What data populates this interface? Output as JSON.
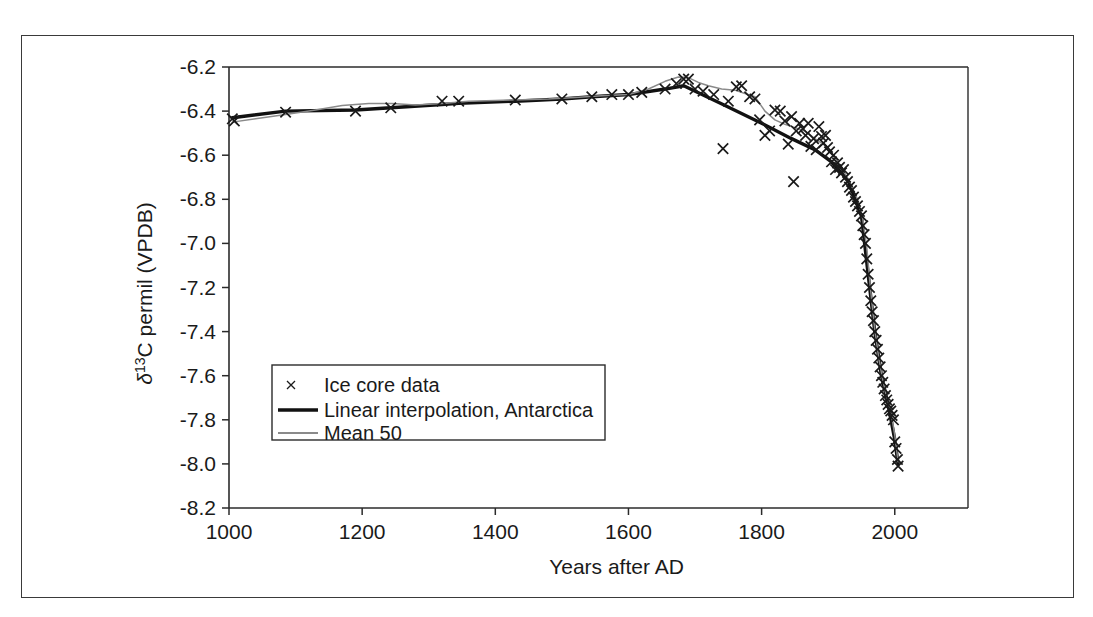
{
  "figure": {
    "frame_color": "#3a3a3a",
    "background": "#ffffff"
  },
  "axes": {
    "x_title": "Years after AD",
    "y_title_delta": "δ",
    "y_title_sup": "13",
    "y_title_rest": "C permil (VPDB)",
    "y_title_plain": "δ13C permil (VPDB)",
    "x_ticks": [
      "1000",
      "1200",
      "1400",
      "1600",
      "1800",
      "2000"
    ],
    "y_ticks": [
      "-6.2",
      "-6.4",
      "-6.6",
      "-6.8",
      "-7.0",
      "-7.2",
      "-7.4",
      "-7.6",
      "-7.8",
      "-8.0",
      "-8.2"
    ]
  },
  "legend": {
    "items": [
      {
        "label": "Ice core data",
        "marker": "cross-marker",
        "color": "#1a1a1a"
      },
      {
        "label": "Linear interpolation, Antarctica",
        "marker": "thick-line",
        "color": "#111111"
      },
      {
        "label": "Mean 50",
        "marker": "thin-line",
        "color": "#8a8a8a"
      }
    ]
  },
  "chart_data": {
    "type": "scatter",
    "title": "",
    "xlabel": "Years after AD",
    "ylabel": "δ13C permil (VPDB)",
    "xlim": [
      1000,
      2110
    ],
    "ylim": [
      -8.2,
      -6.2
    ],
    "grid": false,
    "legend_position": "center-left-lower",
    "x_tick_values": [
      1000,
      1200,
      1400,
      1600,
      1800,
      2000
    ],
    "y_tick_values": [
      -6.2,
      -6.4,
      -6.6,
      -6.8,
      -7.0,
      -7.2,
      -7.4,
      -7.6,
      -7.8,
      -8.0,
      -8.2
    ],
    "series": [
      {
        "name": "Ice core data",
        "type": "scatter",
        "marker": "x",
        "color": "#1a1a1a",
        "points": [
          [
            1005,
            -6.435
          ],
          [
            1008,
            -6.445
          ],
          [
            1085,
            -6.405
          ],
          [
            1190,
            -6.4
          ],
          [
            1243,
            -6.385
          ],
          [
            1320,
            -6.355
          ],
          [
            1345,
            -6.355
          ],
          [
            1430,
            -6.35
          ],
          [
            1500,
            -6.345
          ],
          [
            1545,
            -6.335
          ],
          [
            1575,
            -6.325
          ],
          [
            1600,
            -6.325
          ],
          [
            1620,
            -6.315
          ],
          [
            1655,
            -6.3
          ],
          [
            1672,
            -6.275
          ],
          [
            1683,
            -6.255
          ],
          [
            1690,
            -6.255
          ],
          [
            1700,
            -6.3
          ],
          [
            1712,
            -6.31
          ],
          [
            1728,
            -6.325
          ],
          [
            1742,
            -6.57
          ],
          [
            1750,
            -6.355
          ],
          [
            1762,
            -6.29
          ],
          [
            1770,
            -6.285
          ],
          [
            1782,
            -6.335
          ],
          [
            1790,
            -6.345
          ],
          [
            1797,
            -6.44
          ],
          [
            1805,
            -6.51
          ],
          [
            1812,
            -6.49
          ],
          [
            1820,
            -6.395
          ],
          [
            1828,
            -6.4
          ],
          [
            1835,
            -6.445
          ],
          [
            1840,
            -6.55
          ],
          [
            1845,
            -6.425
          ],
          [
            1848,
            -6.72
          ],
          [
            1852,
            -6.49
          ],
          [
            1857,
            -6.455
          ],
          [
            1862,
            -6.48
          ],
          [
            1866,
            -6.51
          ],
          [
            1870,
            -6.455
          ],
          [
            1874,
            -6.56
          ],
          [
            1878,
            -6.525
          ],
          [
            1882,
            -6.575
          ],
          [
            1886,
            -6.47
          ],
          [
            1890,
            -6.515
          ],
          [
            1893,
            -6.545
          ],
          [
            1896,
            -6.51
          ],
          [
            1899,
            -6.565
          ],
          [
            1902,
            -6.585
          ],
          [
            1905,
            -6.63
          ],
          [
            1908,
            -6.6
          ],
          [
            1911,
            -6.665
          ],
          [
            1914,
            -6.635
          ],
          [
            1917,
            -6.655
          ],
          [
            1920,
            -6.68
          ],
          [
            1923,
            -6.665
          ],
          [
            1926,
            -6.7
          ],
          [
            1929,
            -6.72
          ],
          [
            1932,
            -6.745
          ],
          [
            1935,
            -6.76
          ],
          [
            1938,
            -6.79
          ],
          [
            1941,
            -6.81
          ],
          [
            1944,
            -6.83
          ],
          [
            1947,
            -6.855
          ],
          [
            1950,
            -6.875
          ],
          [
            1952,
            -6.92
          ],
          [
            1954,
            -6.96
          ],
          [
            1956,
            -7.0
          ],
          [
            1958,
            -7.07
          ],
          [
            1960,
            -7.14
          ],
          [
            1962,
            -7.2
          ],
          [
            1964,
            -7.26
          ],
          [
            1966,
            -7.31
          ],
          [
            1968,
            -7.35
          ],
          [
            1970,
            -7.4
          ],
          [
            1972,
            -7.44
          ],
          [
            1974,
            -7.48
          ],
          [
            1976,
            -7.52
          ],
          [
            1978,
            -7.56
          ],
          [
            1980,
            -7.6
          ],
          [
            1982,
            -7.63
          ],
          [
            1984,
            -7.66
          ],
          [
            1986,
            -7.69
          ],
          [
            1988,
            -7.71
          ],
          [
            1990,
            -7.73
          ],
          [
            1992,
            -7.75
          ],
          [
            1994,
            -7.76
          ],
          [
            1996,
            -7.78
          ],
          [
            1998,
            -7.8
          ],
          [
            2000,
            -7.9
          ],
          [
            2002,
            -7.93
          ],
          [
            2004,
            -7.98
          ],
          [
            2005,
            -8.01
          ]
        ]
      },
      {
        "name": "Linear interpolation, Antarctica",
        "type": "line",
        "style": "thick",
        "color": "#111111",
        "points": [
          [
            1005,
            -6.43
          ],
          [
            1085,
            -6.4
          ],
          [
            1190,
            -6.395
          ],
          [
            1243,
            -6.385
          ],
          [
            1320,
            -6.37
          ],
          [
            1345,
            -6.365
          ],
          [
            1430,
            -6.355
          ],
          [
            1500,
            -6.345
          ],
          [
            1545,
            -6.335
          ],
          [
            1600,
            -6.325
          ],
          [
            1655,
            -6.3
          ],
          [
            1683,
            -6.285
          ],
          [
            1742,
            -6.37
          ],
          [
            1800,
            -6.455
          ],
          [
            1845,
            -6.525
          ],
          [
            1880,
            -6.575
          ],
          [
            1905,
            -6.63
          ],
          [
            1930,
            -6.715
          ],
          [
            1950,
            -6.875
          ],
          [
            1960,
            -7.14
          ],
          [
            1970,
            -7.4
          ],
          [
            1980,
            -7.6
          ],
          [
            1990,
            -7.73
          ],
          [
            2000,
            -7.89
          ],
          [
            2005,
            -8.0
          ]
        ]
      },
      {
        "name": "Mean 50",
        "type": "line",
        "style": "thin",
        "color": "#8a8a8a",
        "points": [
          [
            1005,
            -6.45
          ],
          [
            1040,
            -6.435
          ],
          [
            1085,
            -6.415
          ],
          [
            1130,
            -6.395
          ],
          [
            1170,
            -6.375
          ],
          [
            1210,
            -6.365
          ],
          [
            1245,
            -6.365
          ],
          [
            1280,
            -6.372
          ],
          [
            1320,
            -6.365
          ],
          [
            1360,
            -6.355
          ],
          [
            1400,
            -6.352
          ],
          [
            1440,
            -6.348
          ],
          [
            1480,
            -6.345
          ],
          [
            1520,
            -6.338
          ],
          [
            1560,
            -6.33
          ],
          [
            1600,
            -6.325
          ],
          [
            1630,
            -6.3
          ],
          [
            1655,
            -6.265
          ],
          [
            1675,
            -6.245
          ],
          [
            1690,
            -6.248
          ],
          [
            1705,
            -6.27
          ],
          [
            1720,
            -6.285
          ],
          [
            1740,
            -6.3
          ],
          [
            1760,
            -6.305
          ],
          [
            1775,
            -6.32
          ],
          [
            1790,
            -6.335
          ],
          [
            1805,
            -6.4
          ],
          [
            1820,
            -6.44
          ],
          [
            1835,
            -6.46
          ],
          [
            1850,
            -6.475
          ],
          [
            1865,
            -6.49
          ],
          [
            1880,
            -6.525
          ],
          [
            1895,
            -6.555
          ],
          [
            1908,
            -6.6
          ],
          [
            1920,
            -6.655
          ],
          [
            1932,
            -6.72
          ],
          [
            1944,
            -6.8
          ],
          [
            1952,
            -6.89
          ],
          [
            1958,
            -7.02
          ],
          [
            1964,
            -7.22
          ],
          [
            1970,
            -7.39
          ],
          [
            1976,
            -7.52
          ],
          [
            1982,
            -7.62
          ],
          [
            1988,
            -7.7
          ],
          [
            1994,
            -7.76
          ],
          [
            2000,
            -7.87
          ],
          [
            2005,
            -7.99
          ]
        ]
      }
    ]
  }
}
